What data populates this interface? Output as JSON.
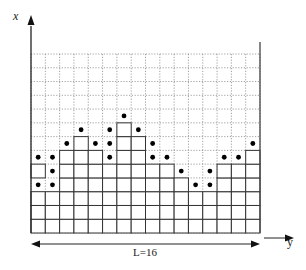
{
  "diagram": {
    "axis_labels": {
      "vertical": "x",
      "horizontal": "y"
    },
    "length_label": "L=16",
    "system_length": 16,
    "grid": {
      "columns": 16,
      "rows": 13
    },
    "column_heights": [
      3,
      3,
      6,
      7,
      6,
      5,
      8,
      7,
      5,
      5,
      4,
      3,
      3,
      5,
      5,
      6
    ],
    "overhang_blocks": [
      {
        "column": 1,
        "row": 5
      }
    ],
    "dots": [
      {
        "column": 1,
        "row": 4
      },
      {
        "column": 1,
        "row": 6
      },
      {
        "column": 2,
        "row": 4
      },
      {
        "column": 2,
        "row": 5
      },
      {
        "column": 2,
        "row": 6
      },
      {
        "column": 3,
        "row": 7
      },
      {
        "column": 4,
        "row": 8
      },
      {
        "column": 5,
        "row": 7
      },
      {
        "column": 6,
        "row": 6
      },
      {
        "column": 6,
        "row": 7
      },
      {
        "column": 6,
        "row": 8
      },
      {
        "column": 7,
        "row": 9
      },
      {
        "column": 8,
        "row": 8
      },
      {
        "column": 9,
        "row": 6
      },
      {
        "column": 9,
        "row": 7
      },
      {
        "column": 10,
        "row": 6
      },
      {
        "column": 11,
        "row": 5
      },
      {
        "column": 12,
        "row": 4
      },
      {
        "column": 13,
        "row": 4
      },
      {
        "column": 13,
        "row": 5
      },
      {
        "column": 14,
        "row": 6
      },
      {
        "column": 15,
        "row": 6
      },
      {
        "column": 16,
        "row": 7
      }
    ],
    "colors": {
      "line": "#333333",
      "dotted": "#888888",
      "dot": "#000000",
      "background": "#ffffff"
    }
  }
}
